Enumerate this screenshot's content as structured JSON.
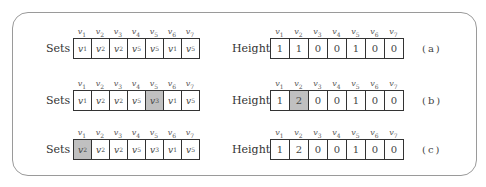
{
  "figure": {
    "sets_label": "Sets",
    "height_label": "Height",
    "vertex_headers": [
      {
        "base": "v",
        "sub": "1"
      },
      {
        "base": "v",
        "sub": "2"
      },
      {
        "base": "v",
        "sub": "3"
      },
      {
        "base": "v",
        "sub": "4"
      },
      {
        "base": "v",
        "sub": "5"
      },
      {
        "base": "v",
        "sub": "6"
      },
      {
        "base": "v",
        "sub": "7"
      }
    ],
    "highlight_color": "#c0c0c0",
    "rows": [
      {
        "caption": "(a)",
        "sets": [
          {
            "sub": "1",
            "highlight": false
          },
          {
            "sub": "2",
            "highlight": false
          },
          {
            "sub": "2",
            "highlight": false
          },
          {
            "sub": "5",
            "highlight": false
          },
          {
            "sub": "5",
            "highlight": false
          },
          {
            "sub": "1",
            "highlight": false
          },
          {
            "sub": "5",
            "highlight": false
          }
        ],
        "heights": [
          {
            "value": "1",
            "highlight": false
          },
          {
            "value": "1",
            "highlight": false
          },
          {
            "value": "0",
            "highlight": false
          },
          {
            "value": "0",
            "highlight": false
          },
          {
            "value": "1",
            "highlight": false
          },
          {
            "value": "0",
            "highlight": false
          },
          {
            "value": "0",
            "highlight": false
          }
        ]
      },
      {
        "caption": "(b)",
        "sets": [
          {
            "sub": "1",
            "highlight": false
          },
          {
            "sub": "2",
            "highlight": false
          },
          {
            "sub": "2",
            "highlight": false
          },
          {
            "sub": "5",
            "highlight": false
          },
          {
            "sub": "3",
            "highlight": true
          },
          {
            "sub": "1",
            "highlight": false
          },
          {
            "sub": "5",
            "highlight": false
          }
        ],
        "heights": [
          {
            "value": "1",
            "highlight": false
          },
          {
            "value": "2",
            "highlight": true
          },
          {
            "value": "0",
            "highlight": false
          },
          {
            "value": "0",
            "highlight": false
          },
          {
            "value": "1",
            "highlight": false
          },
          {
            "value": "0",
            "highlight": false
          },
          {
            "value": "0",
            "highlight": false
          }
        ]
      },
      {
        "caption": "(c)",
        "sets": [
          {
            "sub": "2",
            "highlight": true
          },
          {
            "sub": "2",
            "highlight": false
          },
          {
            "sub": "2",
            "highlight": false
          },
          {
            "sub": "5",
            "highlight": false
          },
          {
            "sub": "3",
            "highlight": false
          },
          {
            "sub": "1",
            "highlight": false
          },
          {
            "sub": "5",
            "highlight": false
          }
        ],
        "heights": [
          {
            "value": "1",
            "highlight": false
          },
          {
            "value": "2",
            "highlight": false
          },
          {
            "value": "0",
            "highlight": false
          },
          {
            "value": "0",
            "highlight": false
          },
          {
            "value": "1",
            "highlight": false
          },
          {
            "value": "0",
            "highlight": false
          },
          {
            "value": "0",
            "highlight": false
          }
        ]
      }
    ]
  }
}
